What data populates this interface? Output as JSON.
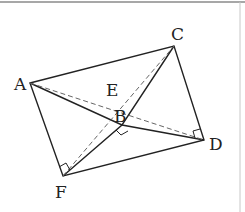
{
  "diagram": {
    "type": "geometry",
    "points": {
      "A": {
        "label": "A",
        "x": 30,
        "y": 83
      },
      "C": {
        "label": "C",
        "x": 174,
        "y": 46
      },
      "D": {
        "label": "D",
        "x": 204,
        "y": 140
      },
      "F": {
        "label": "F",
        "x": 63,
        "y": 176
      },
      "B": {
        "label": "B",
        "x": 122,
        "y": 125
      },
      "E": {
        "label": "E",
        "x": 115,
        "y": 101
      }
    },
    "solid_segments": [
      "AC",
      "CD",
      "DF",
      "FA",
      "AB",
      "BD",
      "FB",
      "BC"
    ],
    "dashed_segments": [
      "AD",
      "FC"
    ],
    "right_angles": [
      "at B (between BF and BD)",
      "at D (between DC and DB)",
      "at F (between FA and FC)"
    ],
    "colors": {
      "stroke": "#222222",
      "dashed": "#666666",
      "border": "#999999"
    }
  }
}
